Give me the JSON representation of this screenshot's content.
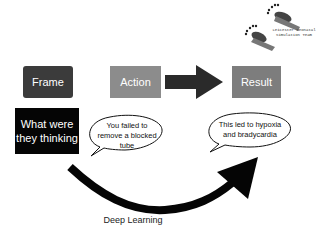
{
  "logo": {
    "line1": "Leicester Neonatal",
    "line2": "Simulation Team",
    "icon": "footprints-icon"
  },
  "boxes": {
    "frame": "Frame",
    "action": "Action",
    "result": "Result",
    "thinking_line1": "What were",
    "thinking_line2": "they thinking"
  },
  "bubbles": {
    "action_bubble": "You failed to remove a blocked tube",
    "result_bubble": "This led to hypoxia and bradycardia"
  },
  "caption": "Deep Learning",
  "colors": {
    "frame": "#3b3b3b",
    "action": "#8c8c8c",
    "result": "#7d7d7d",
    "thinking": "#050505",
    "arrow": "#2a2a2a"
  }
}
